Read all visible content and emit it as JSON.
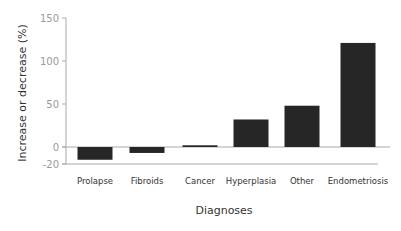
{
  "chart_data": {
    "type": "bar",
    "title": "",
    "xlabel": "Diagnoses",
    "ylabel": "Increase or decrease (%)",
    "categories": [
      "Prolapse",
      "Fibroids",
      "Cancer",
      "Hyperplasia",
      "Other",
      "Endometriosis"
    ],
    "values": [
      -15,
      -7,
      2,
      32,
      48,
      121
    ],
    "yticks": [
      -20,
      0,
      50,
      100,
      150
    ],
    "ylim": [
      -20,
      150
    ],
    "grid": false,
    "legend": null,
    "bar_color": "#262626",
    "axis_color": "#aaaaaa"
  }
}
